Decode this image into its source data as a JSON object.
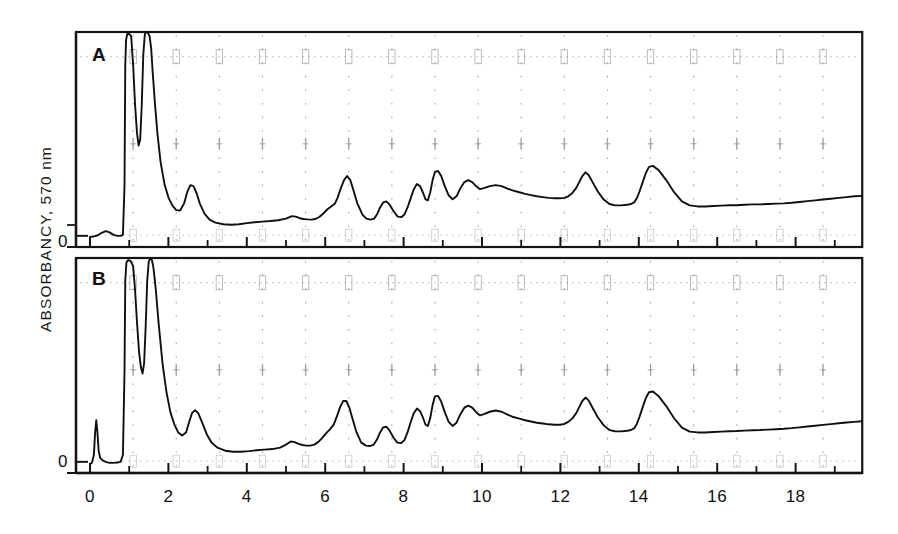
{
  "figure": {
    "yaxis_label": "ABSORBANCY, 570 nm",
    "zero_label_a": "0",
    "zero_label_b": "0",
    "panel_a_letter": "A",
    "panel_b_letter": "B"
  },
  "chart_data": {
    "type": "line",
    "title": "",
    "subtitle": "",
    "xlabel": "",
    "ylabel": "ABSORBANCY, 570 nm",
    "xlim": [
      0,
      19.7
    ],
    "ylim": [
      0,
      1
    ],
    "grid": true,
    "grid_style": "faint dotted recorder-chart gridlines",
    "legend": "none",
    "panels": [
      {
        "id": "A",
        "label": "A",
        "y_tick_labels": [
          "0"
        ],
        "x_tick_labels": [
          "0",
          "2",
          "4",
          "6",
          "8",
          "10",
          "12",
          "14",
          "16",
          "18"
        ],
        "x_major_ticks": [
          0,
          2,
          4,
          6,
          8,
          10,
          12,
          14,
          16,
          18
        ],
        "x_minor_ticks": [
          1,
          3,
          5,
          7,
          9,
          11,
          13,
          15,
          17,
          19
        ],
        "note": "off-scale solvent/front peaks near 1.0 and 1.5 run off the top of the frame",
        "series": [
          {
            "name": "trace A",
            "x": [
              0.0,
              0.1,
              0.2,
              0.3,
              0.4,
              0.5,
              0.6,
              0.7,
              0.78,
              0.84,
              0.88,
              0.9,
              0.92,
              0.95,
              1.0,
              1.05,
              1.1,
              1.15,
              1.2,
              1.24,
              1.28,
              1.32,
              1.36,
              1.4,
              1.44,
              1.48,
              1.52,
              1.56,
              1.6,
              1.66,
              1.72,
              1.8,
              1.9,
              2.0,
              2.1,
              2.2,
              2.3,
              2.4,
              2.48,
              2.56,
              2.64,
              2.72,
              2.8,
              2.92,
              3.05,
              3.2,
              3.4,
              3.6,
              3.8,
              4.0,
              4.2,
              4.4,
              4.6,
              4.8,
              5.0,
              5.15,
              5.25,
              5.35,
              5.45,
              5.55,
              5.65,
              5.75,
              5.85,
              5.95,
              6.05,
              6.15,
              6.25,
              6.32,
              6.4,
              6.48,
              6.56,
              6.64,
              6.72,
              6.82,
              6.95,
              7.05,
              7.15,
              7.25,
              7.32,
              7.4,
              7.48,
              7.56,
              7.64,
              7.75,
              7.85,
              7.95,
              8.02,
              8.1,
              8.18,
              8.26,
              8.34,
              8.42,
              8.5,
              8.56,
              8.62,
              8.68,
              8.74,
              8.8,
              8.88,
              8.96,
              9.05,
              9.15,
              9.25,
              9.35,
              9.45,
              9.55,
              9.65,
              9.75,
              9.85,
              9.95,
              10.05,
              10.2,
              10.35,
              10.5,
              10.65,
              10.8,
              10.95,
              11.1,
              11.25,
              11.4,
              11.55,
              11.7,
              11.85,
              12.0,
              12.1,
              12.2,
              12.3,
              12.4,
              12.48,
              12.56,
              12.64,
              12.72,
              12.82,
              12.95,
              13.1,
              13.25,
              13.4,
              13.55,
              13.7,
              13.8,
              13.88,
              13.95,
              14.02,
              14.1,
              14.18,
              14.26,
              14.36,
              14.5,
              14.7,
              14.9,
              15.1,
              15.3,
              15.5,
              15.7,
              15.9,
              16.1,
              16.3,
              16.5,
              16.7,
              16.9,
              17.1,
              17.3,
              17.5,
              17.7,
              17.9,
              18.1,
              18.3,
              18.5,
              18.7,
              18.9,
              19.1,
              19.3,
              19.5,
              19.7
            ],
            "y": [
              0.05,
              0.052,
              0.058,
              0.07,
              0.078,
              0.072,
              0.06,
              0.055,
              0.055,
              0.06,
              0.3,
              0.9,
              1.02,
              1.05,
              1.05,
              1.04,
              0.9,
              0.7,
              0.56,
              0.5,
              0.53,
              0.7,
              0.95,
              1.05,
              1.06,
              1.055,
              1.04,
              0.98,
              0.86,
              0.7,
              0.56,
              0.42,
              0.31,
              0.245,
              0.205,
              0.182,
              0.18,
              0.215,
              0.27,
              0.305,
              0.3,
              0.265,
              0.215,
              0.165,
              0.135,
              0.12,
              0.112,
              0.11,
              0.112,
              0.118,
              0.122,
              0.125,
              0.128,
              0.132,
              0.14,
              0.152,
              0.15,
              0.142,
              0.138,
              0.136,
              0.135,
              0.138,
              0.148,
              0.165,
              0.185,
              0.2,
              0.215,
              0.245,
              0.29,
              0.33,
              0.35,
              0.33,
              0.28,
              0.215,
              0.16,
              0.14,
              0.135,
              0.14,
              0.16,
              0.195,
              0.22,
              0.225,
              0.21,
              0.175,
              0.15,
              0.148,
              0.16,
              0.195,
              0.24,
              0.285,
              0.31,
              0.3,
              0.265,
              0.235,
              0.23,
              0.27,
              0.33,
              0.37,
              0.375,
              0.35,
              0.3,
              0.255,
              0.235,
              0.25,
              0.29,
              0.32,
              0.33,
              0.32,
              0.3,
              0.285,
              0.29,
              0.3,
              0.305,
              0.3,
              0.288,
              0.278,
              0.27,
              0.262,
              0.256,
              0.25,
              0.246,
              0.242,
              0.24,
              0.24,
              0.242,
              0.25,
              0.265,
              0.29,
              0.32,
              0.35,
              0.368,
              0.355,
              0.32,
              0.275,
              0.235,
              0.212,
              0.205,
              0.205,
              0.208,
              0.212,
              0.22,
              0.24,
              0.275,
              0.32,
              0.365,
              0.395,
              0.4,
              0.38,
              0.33,
              0.27,
              0.225,
              0.205,
              0.2,
              0.2,
              0.202,
              0.204,
              0.206,
              0.206,
              0.208,
              0.21,
              0.21,
              0.212,
              0.214,
              0.215,
              0.218,
              0.222,
              0.226,
              0.23,
              0.234,
              0.238,
              0.242,
              0.246,
              0.25,
              0.252,
              0.255,
              0.258,
              0.262,
              0.265,
              0.268,
              0.27,
              0.272,
              0.275,
              0.278
            ]
          }
        ]
      },
      {
        "id": "B",
        "label": "B",
        "y_tick_labels": [
          "0"
        ],
        "x_tick_labels": [
          "0",
          "2",
          "4",
          "6",
          "8",
          "10",
          "12",
          "14",
          "16",
          "18"
        ],
        "x_major_ticks": [
          0,
          2,
          4,
          6,
          8,
          10,
          12,
          14,
          16,
          18
        ],
        "x_minor_ticks": [
          1,
          3,
          5,
          7,
          9,
          11,
          13,
          15,
          17,
          19
        ],
        "note": "additional sharp early peak near 0.15; off-scale peaks near 1.1 and 1.5",
        "series": [
          {
            "name": "trace B",
            "x": [
              0.0,
              0.05,
              0.1,
              0.13,
              0.16,
              0.19,
              0.22,
              0.26,
              0.32,
              0.4,
              0.5,
              0.6,
              0.7,
              0.78,
              0.84,
              0.88,
              0.9,
              0.93,
              0.98,
              1.04,
              1.1,
              1.15,
              1.2,
              1.25,
              1.3,
              1.34,
              1.38,
              1.42,
              1.46,
              1.5,
              1.54,
              1.58,
              1.62,
              1.68,
              1.75,
              1.85,
              1.95,
              2.05,
              2.15,
              2.25,
              2.35,
              2.45,
              2.52,
              2.6,
              2.68,
              2.76,
              2.86,
              2.98,
              3.1,
              3.25,
              3.45,
              3.65,
              3.85,
              4.05,
              4.25,
              4.45,
              4.65,
              4.85,
              5.0,
              5.12,
              5.22,
              5.32,
              5.42,
              5.52,
              5.62,
              5.72,
              5.82,
              5.92,
              6.02,
              6.12,
              6.22,
              6.3,
              6.38,
              6.46,
              6.54,
              6.62,
              6.7,
              6.8,
              6.92,
              7.04,
              7.14,
              7.24,
              7.32,
              7.4,
              7.48,
              7.56,
              7.64,
              7.74,
              7.84,
              7.94,
              8.02,
              8.1,
              8.18,
              8.26,
              8.34,
              8.42,
              8.5,
              8.56,
              8.62,
              8.68,
              8.74,
              8.8,
              8.88,
              8.96,
              9.05,
              9.15,
              9.25,
              9.35,
              9.45,
              9.55,
              9.65,
              9.75,
              9.85,
              9.95,
              10.05,
              10.2,
              10.35,
              10.5,
              10.65,
              10.8,
              10.95,
              11.1,
              11.25,
              11.4,
              11.55,
              11.7,
              11.85,
              12.0,
              12.1,
              12.2,
              12.3,
              12.4,
              12.48,
              12.56,
              12.64,
              12.72,
              12.82,
              12.95,
              13.1,
              13.25,
              13.4,
              13.55,
              13.7,
              13.8,
              13.88,
              13.95,
              14.02,
              14.1,
              14.18,
              14.26,
              14.36,
              14.5,
              14.7,
              14.9,
              15.1,
              15.3,
              15.5,
              15.7,
              15.9,
              16.1,
              16.3,
              16.5,
              16.7,
              16.9,
              17.1,
              17.3,
              17.5,
              17.7,
              17.9,
              18.1,
              18.3,
              18.5,
              18.7,
              18.9,
              19.1,
              19.3,
              19.5,
              19.7
            ],
            "y": [
              0.045,
              0.05,
              0.09,
              0.2,
              0.26,
              0.2,
              0.11,
              0.075,
              0.062,
              0.055,
              0.05,
              0.05,
              0.052,
              0.055,
              0.09,
              0.5,
              0.95,
              1.04,
              1.05,
              1.045,
              1.02,
              0.9,
              0.74,
              0.6,
              0.52,
              0.49,
              0.54,
              0.72,
              0.95,
              1.045,
              1.055,
              1.05,
              1.01,
              0.9,
              0.74,
              0.54,
              0.4,
              0.3,
              0.24,
              0.2,
              0.185,
              0.2,
              0.245,
              0.295,
              0.31,
              0.295,
              0.25,
              0.19,
              0.15,
              0.125,
              0.11,
              0.105,
              0.105,
              0.108,
              0.112,
              0.115,
              0.118,
              0.125,
              0.14,
              0.155,
              0.152,
              0.144,
              0.138,
              0.135,
              0.135,
              0.14,
              0.152,
              0.172,
              0.195,
              0.215,
              0.24,
              0.28,
              0.325,
              0.355,
              0.355,
              0.32,
              0.265,
              0.2,
              0.15,
              0.135,
              0.133,
              0.14,
              0.165,
              0.2,
              0.225,
              0.228,
              0.21,
              0.175,
              0.15,
              0.148,
              0.162,
              0.2,
              0.25,
              0.295,
              0.318,
              0.305,
              0.27,
              0.238,
              0.232,
              0.272,
              0.335,
              0.378,
              0.38,
              0.352,
              0.3,
              0.252,
              0.232,
              0.248,
              0.29,
              0.322,
              0.332,
              0.322,
              0.3,
              0.284,
              0.29,
              0.302,
              0.308,
              0.302,
              0.288,
              0.276,
              0.268,
              0.26,
              0.254,
              0.248,
              0.244,
              0.24,
              0.238,
              0.238,
              0.242,
              0.252,
              0.268,
              0.294,
              0.325,
              0.355,
              0.372,
              0.358,
              0.322,
              0.276,
              0.236,
              0.212,
              0.205,
              0.205,
              0.208,
              0.212,
              0.22,
              0.242,
              0.278,
              0.325,
              0.37,
              0.398,
              0.402,
              0.38,
              0.33,
              0.27,
              0.224,
              0.204,
              0.2,
              0.2,
              0.202,
              0.204,
              0.206,
              0.207,
              0.209,
              0.211,
              0.212,
              0.214,
              0.216,
              0.218,
              0.221,
              0.225,
              0.229,
              0.233,
              0.237,
              0.241,
              0.245,
              0.249,
              0.252,
              0.255,
              0.258,
              0.261,
              0.264,
              0.267,
              0.27,
              0.273,
              0.276,
              0.28
            ]
          }
        ]
      }
    ]
  },
  "colors": {
    "trace": "#101010",
    "frame": "#151515",
    "grid": "#9a9a9a",
    "background": "#ffffff"
  }
}
